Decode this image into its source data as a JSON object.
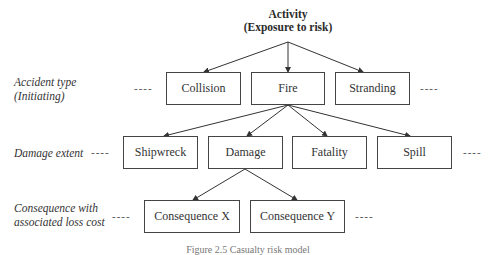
{
  "root": {
    "line1": "Activity",
    "line2": "(Exposure to risk)"
  },
  "levels": {
    "accident_type": {
      "line1": "Accident type",
      "line2": "(Initiating)"
    },
    "damage_extent": {
      "line1": "Damage extent"
    },
    "consequence": {
      "line1": "Consequence with",
      "line2": "associated loss cost"
    }
  },
  "accident_types": [
    "Collision",
    "Fire",
    "Stranding"
  ],
  "damage_extents": [
    "Shipwreck",
    "Damage",
    "Fatality",
    "Spill"
  ],
  "consequences": [
    "Consequence X",
    "Consequence Y"
  ],
  "continuation": "----",
  "caption": "Figure 2.5 Casualty risk model"
}
